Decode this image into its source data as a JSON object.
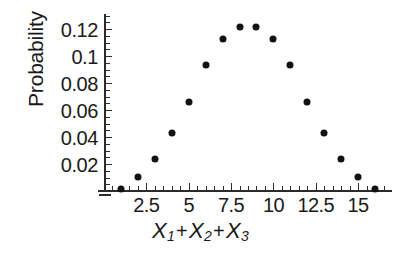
{
  "chart_data": {
    "type": "scatter",
    "title": "",
    "xlabel": "X1 + X2 + X3",
    "ylabel": "Probability",
    "x": [
      1,
      2,
      3,
      4,
      5,
      6,
      7,
      8,
      9,
      10,
      11,
      12,
      13,
      14,
      15,
      16
    ],
    "values": [
      0.005,
      0.014,
      0.027,
      0.046,
      0.069,
      0.097,
      0.116,
      0.125,
      0.125,
      0.116,
      0.097,
      0.069,
      0.046,
      0.027,
      0.014,
      0.005
    ],
    "xlim": [
      0,
      17
    ],
    "ylim": [
      0,
      0.132
    ],
    "xticks": [
      2.5,
      5,
      7.5,
      10,
      12.5,
      15
    ],
    "xtick_labels": [
      "2.5",
      "5",
      "7.5",
      "10",
      "12.5",
      "15"
    ],
    "yticks": [
      0.02,
      0.04,
      0.06,
      0.08,
      0.1,
      0.12
    ],
    "ytick_labels": [
      "0.02",
      "0.04",
      "0.06",
      "0.08",
      "0.1",
      "0.12"
    ],
    "x_minor_step": 0.5,
    "y_minor_step": 0.005,
    "grid": false,
    "legend": "none",
    "marker": "filled-circle",
    "marker_color": "#111111",
    "axis_color": "#2b2b2b",
    "background": "#ffffff"
  },
  "axis_label_parts": {
    "x1": "X",
    "s1": "1",
    "plus1": "+",
    "x2": "X",
    "s2": "2",
    "plus2": "+",
    "x3": "X",
    "s3": "3"
  }
}
